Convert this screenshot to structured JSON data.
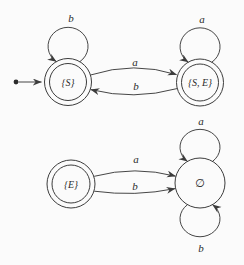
{
  "figure": {
    "type": "finite-automaton-diagram",
    "background": "#fbfbfb",
    "line_color": "#3c3c3c",
    "text_color": "#2b2b2b"
  },
  "top_automaton": {
    "states": [
      {
        "id": "S",
        "label": "{S}",
        "accepting": true,
        "initial": true
      },
      {
        "id": "SE",
        "label": "{S, E}",
        "accepting": true,
        "initial": false
      }
    ],
    "transitions": [
      {
        "from": "S",
        "to": "S",
        "symbol": "b",
        "shape": "self-loop-top"
      },
      {
        "from": "SE",
        "to": "SE",
        "symbol": "a",
        "shape": "self-loop-top"
      },
      {
        "from": "S",
        "to": "SE",
        "symbol": "a",
        "shape": "curve-upper"
      },
      {
        "from": "SE",
        "to": "S",
        "symbol": "b",
        "shape": "curve-lower"
      }
    ]
  },
  "bottom_automaton": {
    "states": [
      {
        "id": "E",
        "label": "{E}",
        "accepting": true,
        "initial": false
      },
      {
        "id": "empty",
        "label": "∅",
        "accepting": false,
        "initial": false
      }
    ],
    "transitions": [
      {
        "from": "E",
        "to": "empty",
        "symbol": "a",
        "shape": "curve-upper"
      },
      {
        "from": "E",
        "to": "empty",
        "symbol": "b",
        "shape": "curve-lower"
      },
      {
        "from": "empty",
        "to": "empty",
        "symbol": "a",
        "shape": "self-loop-top"
      },
      {
        "from": "empty",
        "to": "empty",
        "symbol": "b",
        "shape": "self-loop-bottom"
      }
    ]
  }
}
